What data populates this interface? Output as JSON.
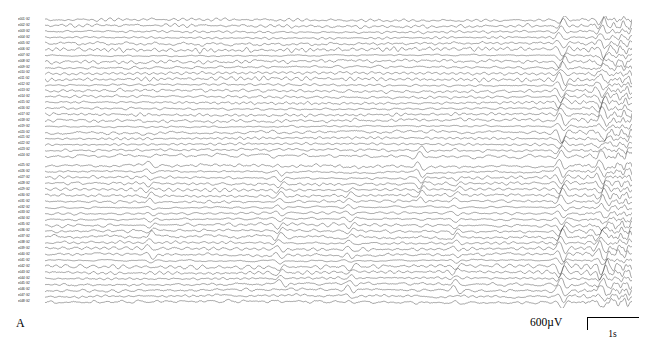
{
  "figure": {
    "panel_letter": "A",
    "type": "multichannel-eeg-trace-plot"
  },
  "scale_bar": {
    "amplitude_label": "600µV",
    "time_label": "1s"
  },
  "plot": {
    "channel_label_prefix": "e",
    "channel_label_suffix": "G2",
    "trace_color": "#111111",
    "background_color": "#ffffff",
    "channel_count": 48,
    "block_gap_after_channel": 24,
    "channel_labels": [
      "e001 G2",
      "e002 G2",
      "e003 G2",
      "e004 G2",
      "e005 G2",
      "e006 G2",
      "e007 G2",
      "e008 G2",
      "e009 G2",
      "e010 G2",
      "e011 G2",
      "e012 G2",
      "e013 G2",
      "e014 G2",
      "e015 G2",
      "e016 G2",
      "e017 G2",
      "e018 G2",
      "e019 G2",
      "e020 G2",
      "e021 G2",
      "e022 G2",
      "e023 G2",
      "e024 G2",
      "e025 G2",
      "e026 G2",
      "e027 G2",
      "e028 G2",
      "e029 G2",
      "e030 G2",
      "e031 G2",
      "e032 G2",
      "e033 G2",
      "e034 G2",
      "e035 G2",
      "e036 G2",
      "e037 G2",
      "e038 G2",
      "e039 G2",
      "e040 G2",
      "e041 G2",
      "e042 G2",
      "e043 G2",
      "e044 G2",
      "e045 G2",
      "e046 G2",
      "e047 G2",
      "e048 G2"
    ]
  },
  "chart_data": {
    "type": "line",
    "title": "",
    "xlabel": "",
    "ylabel": "",
    "legend": [],
    "grid": false,
    "x_axis_units": "seconds",
    "y_axis_units": "microvolts",
    "amplitude_scale_uV": 600,
    "time_scale_s": 1,
    "time_span_s": 11.5,
    "series_count": 48,
    "series_spacing_px": 6.05,
    "burst_events": [
      {
        "x_fraction": 0.18,
        "channels": [
          24,
          40
        ],
        "relative_amplitude": 1.6
      },
      {
        "x_fraction": 0.4,
        "channels": [
          25,
          44
        ],
        "relative_amplitude": 1.8
      },
      {
        "x_fraction": 0.52,
        "channels": [
          28,
          46
        ],
        "relative_amplitude": 1.4
      },
      {
        "x_fraction": 0.64,
        "channels": [
          22,
          30
        ],
        "relative_amplitude": 2.2
      },
      {
        "x_fraction": 0.7,
        "channels": [
          26,
          45
        ],
        "relative_amplitude": 1.5
      },
      {
        "x_fraction": 0.88,
        "channels": [
          0,
          48
        ],
        "relative_amplitude": 3.0
      },
      {
        "x_fraction": 0.95,
        "channels": [
          0,
          48
        ],
        "relative_amplitude": 2.6
      }
    ]
  }
}
